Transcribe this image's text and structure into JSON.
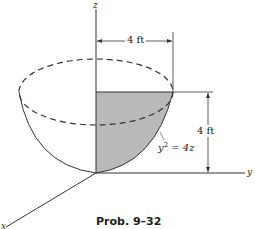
{
  "figure": {
    "caption": "Prob. 9–32",
    "axes": {
      "x": "x",
      "y": "y",
      "z": "z"
    },
    "dimensions": {
      "radius": "4 ft",
      "height": "4 ft"
    },
    "equation": {
      "base": "y",
      "exp": "2",
      "rhs": " = 4z"
    }
  }
}
